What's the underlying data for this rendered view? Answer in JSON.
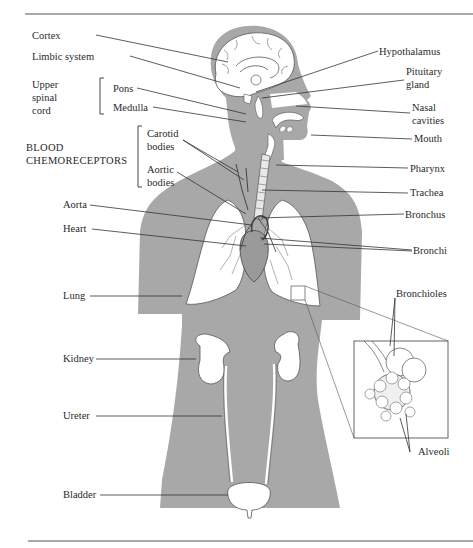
{
  "diagram": {
    "colors": {
      "background": "#ffffff",
      "body_fill": "#a8a8a8",
      "organ_fill": "#ffffff",
      "line": "#333333",
      "rule": "#555555",
      "text": "#2a2a2a"
    },
    "labels_left": [
      {
        "id": "cortex",
        "text": "Cortex"
      },
      {
        "id": "limbic",
        "text": "Limbic system"
      },
      {
        "id": "upper_spinal_cord",
        "text": "Upper\nspinal\ncord"
      },
      {
        "id": "pons",
        "text": "Pons"
      },
      {
        "id": "medulla",
        "text": "Medulla"
      },
      {
        "id": "blood_chemo",
        "text": "BLOOD\nCHEMORECEPTORS"
      },
      {
        "id": "carotid",
        "text": "Carotid\nbodies"
      },
      {
        "id": "aortic_bodies",
        "text": "Aortic\nbodies"
      },
      {
        "id": "aorta",
        "text": "Aorta"
      },
      {
        "id": "heart",
        "text": "Heart"
      },
      {
        "id": "lung",
        "text": "Lung"
      },
      {
        "id": "kidney",
        "text": "Kidney"
      },
      {
        "id": "ureter",
        "text": "Ureter"
      },
      {
        "id": "bladder",
        "text": "Bladder"
      }
    ],
    "labels_right": [
      {
        "id": "hypothalamus",
        "text": "Hypothalamus"
      },
      {
        "id": "pituitary",
        "text": "Pituitary\ngland"
      },
      {
        "id": "nasal",
        "text": "Nasal\ncavities"
      },
      {
        "id": "mouth",
        "text": "Mouth"
      },
      {
        "id": "pharynx",
        "text": "Pharynx"
      },
      {
        "id": "trachea",
        "text": "Trachea"
      },
      {
        "id": "bronchus",
        "text": "Bronchus"
      },
      {
        "id": "bronchi",
        "text": "Bronchi"
      },
      {
        "id": "bronchioles",
        "text": "Bronchioles"
      },
      {
        "id": "alveoli",
        "text": "Alveoli"
      }
    ]
  }
}
